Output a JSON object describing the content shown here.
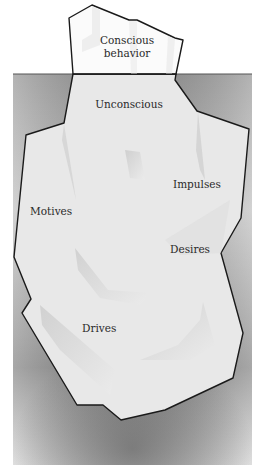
{
  "diagram": {
    "type": "iceberg",
    "colors": {
      "background": "#ffffff",
      "water_light": "#d8d8d8",
      "water_dark": "#6e6e6e",
      "ice_above": "#fbfbfb",
      "ice_below": "#e9e9e9",
      "outline": "#1a1a1a",
      "label": "#2a2a2a"
    },
    "labels": {
      "tip_line1": "Conscious",
      "tip_line2": "behavior",
      "unconscious": "Unconscious",
      "impulses": "Impulses",
      "motives": "Motives",
      "desires": "Desires",
      "drives": "Drives"
    }
  }
}
